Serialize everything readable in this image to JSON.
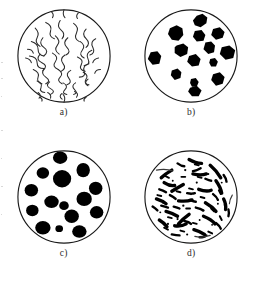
{
  "figure": {
    "background_color": "#ffffff",
    "outline_color": "#1a1a1a",
    "particle_color": "#000000",
    "panel_count": 4,
    "layout": "2x2 grid"
  },
  "panels": [
    {
      "id": "a",
      "label": "a)",
      "morphology": "vermicular-curves",
      "description": "thin squiggly worm-like curved lines filling the circle",
      "feature_count": 42,
      "feature_style": "stroke",
      "stroke_color": "#2b2b2b"
    },
    {
      "id": "b",
      "label": "b)",
      "morphology": "angular-irregular-blobs",
      "description": "irregular jagged dark blobs scattered across the circle",
      "feature_count": 13,
      "feature_style": "fill",
      "fill_color": "#000000"
    },
    {
      "id": "c",
      "label": "c)",
      "morphology": "rounded-nodules",
      "description": "rounded smooth dark nodules of varying size",
      "feature_count": 15,
      "feature_style": "fill",
      "fill_color": "#000000"
    },
    {
      "id": "d",
      "label": "d)",
      "morphology": "dense-short-flakes",
      "description": "many short thick curved dark flakes densely distributed",
      "feature_count": 70,
      "feature_style": "fill",
      "fill_color": "#000000"
    }
  ]
}
